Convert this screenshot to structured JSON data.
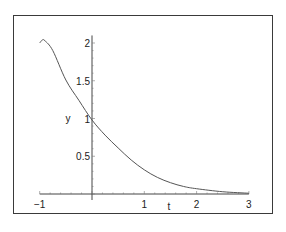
{
  "chart_data": {
    "type": "line",
    "title": "",
    "xlabel": "t",
    "ylabel": "y",
    "xlim": [
      -1,
      3
    ],
    "ylim": [
      0,
      2.1
    ],
    "x_ticks": [
      "-1",
      "1",
      "2",
      "3"
    ],
    "y_ticks": [
      "0.5",
      "1",
      "1.5",
      "2"
    ],
    "grid": false,
    "legend": null,
    "series": [
      {
        "name": "y(t)",
        "color": "#555555",
        "x": [
          -1.0,
          -0.95,
          -0.9,
          -0.75,
          -0.5,
          -0.25,
          0.0,
          0.25,
          0.5,
          0.75,
          1.0,
          1.25,
          1.5,
          1.75,
          2.0,
          2.5,
          3.0
        ],
        "y": [
          2.0,
          2.04,
          2.03,
          1.9,
          1.51,
          1.24,
          0.98,
          0.78,
          0.61,
          0.45,
          0.32,
          0.22,
          0.15,
          0.1,
          0.07,
          0.03,
          0.01
        ]
      }
    ]
  },
  "axes": {
    "x_label": "t",
    "y_label": "y"
  }
}
